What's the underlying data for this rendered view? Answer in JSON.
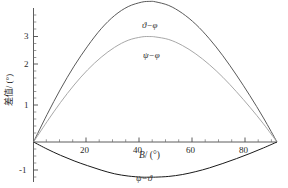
{
  "chart_data": {
    "type": "line",
    "title": "",
    "xlabel": "B/(°)",
    "ylabel": "差值/(°)",
    "xlim": [
      0,
      90
    ],
    "ylim": [
      -1.35,
      4.15
    ],
    "grid": false,
    "legend_position": "inline-annotations",
    "xticks": [
      20,
      40,
      60,
      80
    ],
    "xtick_labels": [
      "20",
      "40",
      "60",
      "80"
    ],
    "yticks": [
      -1,
      1,
      2,
      3
    ],
    "ytick_labels": [
      "-1",
      "1",
      "2",
      "3"
    ],
    "x": [
      0,
      5,
      10,
      15,
      20,
      25,
      30,
      35,
      40,
      43,
      45,
      50,
      55,
      60,
      65,
      70,
      75,
      80,
      85,
      90
    ],
    "series": [
      {
        "name": "ϑ−φ",
        "color": "#5a5a5a",
        "peak_x": 43,
        "peak_y": 3.8,
        "values": [
          0.0,
          0.74,
          1.43,
          2.05,
          2.59,
          3.06,
          3.42,
          3.66,
          3.78,
          3.8,
          3.79,
          3.69,
          3.48,
          3.18,
          2.79,
          2.33,
          1.81,
          1.25,
          0.65,
          0.0
        ]
      },
      {
        "name": "ψ−φ",
        "color": "#a8a8a8",
        "peak_x": 43,
        "peak_y": 2.85,
        "values": [
          0.0,
          0.55,
          1.07,
          1.54,
          1.95,
          2.29,
          2.56,
          2.75,
          2.84,
          2.85,
          2.84,
          2.77,
          2.61,
          2.38,
          2.09,
          1.75,
          1.36,
          0.94,
          0.49,
          0.0
        ]
      },
      {
        "name": "ψ−ϑ",
        "color": "#1a1a1a",
        "peak_x": 45,
        "peak_y": -0.95,
        "values": [
          0.0,
          -0.19,
          -0.36,
          -0.51,
          -0.64,
          -0.76,
          -0.86,
          -0.92,
          -0.95,
          -0.95,
          -0.95,
          -0.93,
          -0.88,
          -0.8,
          -0.7,
          -0.58,
          -0.45,
          -0.31,
          -0.16,
          0.0
        ]
      }
    ],
    "annotations": [
      {
        "text": "ϑ−φ",
        "x_px": 142,
        "y_px": 21
      },
      {
        "text": "ψ−φ",
        "x_px": 143,
        "y_px": 51
      },
      {
        "text": "ψ−ϑ",
        "x_px": 136,
        "y_px": 174
      }
    ]
  },
  "axes": {
    "x_title_symbol": "B",
    "x_title_rest": "/ (°)",
    "y_title": "差值/ (°)",
    "tick_x": [
      "20",
      "40",
      "60",
      "80"
    ],
    "tick_y": [
      "3",
      "2",
      "1",
      "-1"
    ]
  },
  "colors": {
    "background": "#ffffff",
    "axis": "#3a3a3a",
    "curve_theta_phi": "#5a5a5a",
    "curve_psi_phi": "#a8a8a8",
    "curve_psi_theta": "#1a1a1a"
  }
}
